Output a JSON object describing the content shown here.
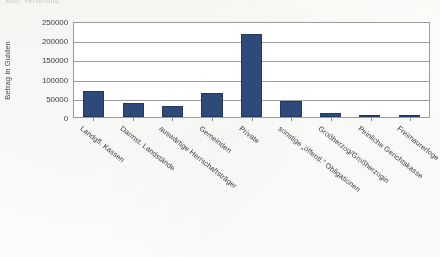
{
  "page": {
    "cut_off_caption": "Abb.    Verteilung"
  },
  "chart_data": {
    "type": "bar",
    "title": "",
    "subtitle": "",
    "xlabel": "",
    "ylabel": "Betrag in Gulden",
    "ylim": [
      0,
      250000
    ],
    "ytick_step": 50000,
    "ytick_labels": [
      "250000",
      "200000",
      "150000",
      "100000",
      "50000",
      "0"
    ],
    "ytick_values": [
      250000,
      200000,
      150000,
      100000,
      50000,
      0
    ],
    "grid": true,
    "grid_axis": "y",
    "legend": false,
    "bar_color": "#2e4a78",
    "plot_border_color": "#9b9b9b",
    "gridline_color": "#9d9d9d",
    "categories": [
      "Landgfl. Kassen",
      "Darmst. Landstände",
      "auswärtige Herrschaftsträger",
      "Gemeinden",
      "Private",
      "sonstige „öffentl.\" Obligationen",
      "Großherzog/Großherzogin",
      "Peinliche Gerichtskasse",
      "Freimaurerloge"
    ],
    "values": [
      68000,
      36000,
      28000,
      62000,
      215000,
      41000,
      10000,
      2500,
      2000
    ]
  }
}
